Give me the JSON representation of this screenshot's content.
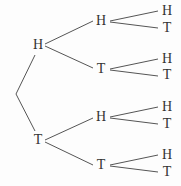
{
  "diagram": {
    "type": "probability-tree",
    "level1": [
      {
        "label": "H",
        "x": 38,
        "y": 45
      },
      {
        "label": "T",
        "x": 38,
        "y": 140
      }
    ],
    "level2": [
      {
        "label": "H",
        "x": 101,
        "y": 21
      },
      {
        "label": "T",
        "x": 101,
        "y": 69
      },
      {
        "label": "H",
        "x": 101,
        "y": 117
      },
      {
        "label": "T",
        "x": 101,
        "y": 165
      }
    ],
    "level3": [
      {
        "label": "H",
        "x": 167,
        "y": 11
      },
      {
        "label": "T",
        "x": 167,
        "y": 28
      },
      {
        "label": "H",
        "x": 167,
        "y": 59
      },
      {
        "label": "T",
        "x": 167,
        "y": 75
      },
      {
        "label": "H",
        "x": 167,
        "y": 107
      },
      {
        "label": "T",
        "x": 167,
        "y": 124
      },
      {
        "label": "H",
        "x": 167,
        "y": 155
      },
      {
        "label": "T",
        "x": 167,
        "y": 172
      }
    ],
    "line_color": "#555555"
  }
}
